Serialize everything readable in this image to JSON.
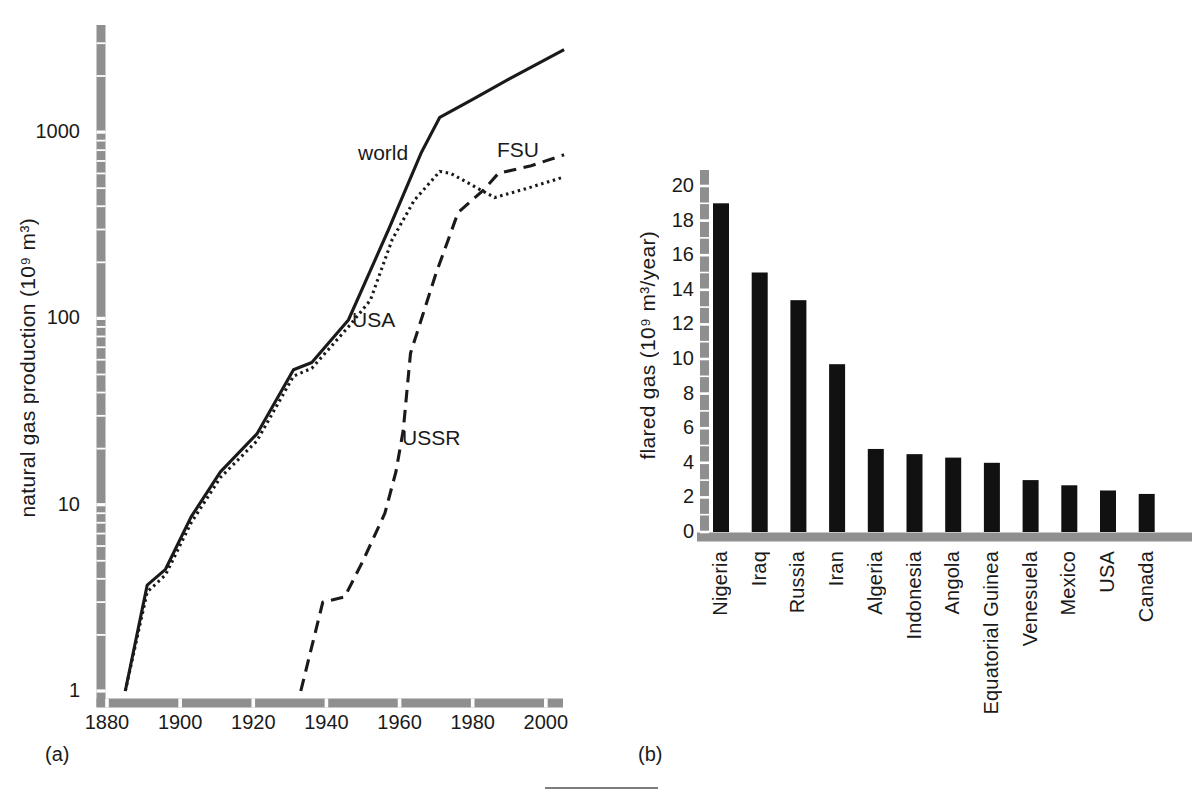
{
  "colors": {
    "ink": "#1a1a1a",
    "axis_band": "#8f8f8f",
    "bar_fill": "#111111",
    "background": "#ffffff",
    "tick_notch": "#ffffff"
  },
  "chart_data": [
    {
      "id": "a",
      "panel_label": "(a)",
      "type": "line",
      "title": "",
      "xlabel": "",
      "ylabel": "natural gas production (10⁹ m³)",
      "y_scale": "log",
      "xlim": [
        1880,
        2005
      ],
      "ylim": [
        1,
        3500
      ],
      "x_ticks": [
        1880,
        1900,
        1920,
        1940,
        1960,
        1980,
        2000
      ],
      "y_ticks": [
        1,
        10,
        100,
        1000
      ],
      "grid": false,
      "legend": "inline-labels",
      "series": [
        {
          "name": "world",
          "label": "world",
          "line_style": "solid",
          "points": [
            [
              1885,
              1
            ],
            [
              1891,
              3.7
            ],
            [
              1896,
              4.5
            ],
            [
              1903,
              8.6
            ],
            [
              1911,
              15
            ],
            [
              1921,
              24
            ],
            [
              1931,
              53
            ],
            [
              1936,
              58
            ],
            [
              1946,
              98
            ],
            [
              1957,
              300
            ],
            [
              1966,
              780
            ],
            [
              1971,
              1200
            ],
            [
              1980,
              1500
            ],
            [
              1990,
              1930
            ],
            [
              2005,
              2770
            ]
          ]
        },
        {
          "name": "USA",
          "label": "USA",
          "line_style": "dotted",
          "points": [
            [
              1885,
              1
            ],
            [
              1891,
              3.4
            ],
            [
              1896,
              4.2
            ],
            [
              1903,
              8.0
            ],
            [
              1911,
              14
            ],
            [
              1921,
              22
            ],
            [
              1931,
              49
            ],
            [
              1936,
              54
            ],
            [
              1946,
              90
            ],
            [
              1952,
              125
            ],
            [
              1958,
              265
            ],
            [
              1964,
              430
            ],
            [
              1971,
              615
            ],
            [
              1974,
              600
            ],
            [
              1986,
              445
            ],
            [
              1995,
              500
            ],
            [
              2005,
              575
            ]
          ]
        },
        {
          "name": "USSR-FSU",
          "label": "USSR",
          "label2": "FSU",
          "line_style": "dashed",
          "points": [
            [
              1933,
              1
            ],
            [
              1939,
              3.0
            ],
            [
              1945,
              3.2
            ],
            [
              1950,
              5.0
            ],
            [
              1956,
              9.0
            ],
            [
              1959,
              15
            ],
            [
              1961,
              25
            ],
            [
              1963,
              65
            ],
            [
              1970,
              175
            ],
            [
              1976,
              370
            ],
            [
              1983,
              490
            ],
            [
              1987,
              600
            ],
            [
              1996,
              660
            ],
            [
              2005,
              755
            ]
          ]
        }
      ]
    },
    {
      "id": "b",
      "panel_label": "(b)",
      "type": "bar",
      "title": "",
      "xlabel": "",
      "ylabel": "flared gas (10⁹ m³/year)",
      "ylim": [
        0,
        21
      ],
      "y_ticks": [
        0,
        2,
        4,
        6,
        8,
        10,
        12,
        14,
        16,
        18,
        20
      ],
      "grid": false,
      "categories": [
        "Nigeria",
        "Iraq",
        "Russia",
        "Iran",
        "Algeria",
        "Indonesia",
        "Angola",
        "Equatorial Guinea",
        "Venesuela",
        "Mexico",
        "USA",
        "Canada"
      ],
      "values": [
        19.0,
        15.0,
        13.4,
        9.7,
        4.8,
        4.5,
        4.3,
        4.0,
        3.0,
        2.7,
        2.4,
        2.2
      ]
    }
  ]
}
